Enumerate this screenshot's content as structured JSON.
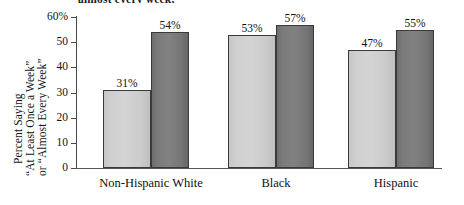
{
  "caption_fragment": "almost every week,",
  "chart_data": {
    "type": "bar",
    "title": "",
    "xlabel": "",
    "ylabel_lines": [
      "Percent Saying",
      "“At Least Once a Week”",
      "or “Almost Every Week”"
    ],
    "categories": [
      "Non-Hispanic White",
      "Black",
      "Hispanic"
    ],
    "series": [
      {
        "name": "light",
        "values": [
          31,
          53,
          47
        ],
        "color": "#d0d0d0"
      },
      {
        "name": "dark",
        "values": [
          54,
          57,
          55
        ],
        "color": "#7a7a7a"
      }
    ],
    "value_labels": [
      [
        "31%",
        "54%"
      ],
      [
        "53%",
        "57%"
      ],
      [
        "47%",
        "55%"
      ]
    ],
    "ylim": [
      0,
      60
    ],
    "yticks": [
      0,
      10,
      20,
      30,
      40,
      50,
      60
    ],
    "ytick_labels": [
      "0",
      "10",
      "20",
      "30",
      "40",
      "50",
      "60%"
    ],
    "grid": false,
    "legend": "none",
    "axis_color": "#4a4a4a",
    "bar_outline_color": "#3a3a3a"
  }
}
